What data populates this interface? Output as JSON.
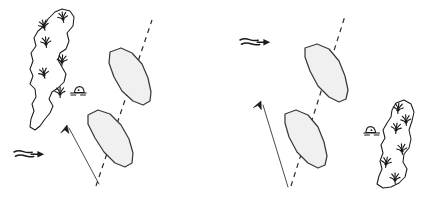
{
  "figure": {
    "background_color": "#ffffff",
    "ink_color": "#1a1a1a",
    "hull_fill_color": "#f0f0f0",
    "hull_stroke_color": "#3a3a3a",
    "width": 431,
    "height": 213
  },
  "panels": [
    {
      "id": "panel-left",
      "name": "left-scenario",
      "island": {
        "name": "island-left",
        "label": "",
        "outline_points": "55,12 62,9 70,11 74,17 73,26 67,33 69,41 66,49 60,53 58,60 62,67 66,74 64,82 58,88 52,92 49,99 53,106 50,113 45,119 40,126 35,130 30,127 31,119 34,111 32,104 36,97 35,89 30,84 33,76 30,69 33,61 31,53 36,46 34,38 38,31 44,26 48,19",
        "vegetation": [
          {
            "name": "grass-tuft",
            "x": 63,
            "y": 19,
            "rotation": -8
          },
          {
            "name": "grass-tuft",
            "x": 44,
            "y": 27,
            "rotation": -14
          },
          {
            "name": "grass-tuft",
            "x": 46,
            "y": 44,
            "rotation": -5
          },
          {
            "name": "grass-tuft",
            "x": 62,
            "y": 62,
            "rotation": 4
          },
          {
            "name": "grass-tuft",
            "x": 44,
            "y": 75,
            "rotation": -12
          },
          {
            "name": "grass-tuft",
            "x": 60,
            "y": 94,
            "rotation": 0
          }
        ]
      },
      "rock_marker": {
        "name": "rock-marker-left",
        "x": 79,
        "y": 90,
        "flip": false
      },
      "boats": [
        {
          "name": "boat-upper-left",
          "hull_points": "110,52 121,48 132,53 142,64 148,78 151,92 150,101 143,105 133,101 122,91 114,77 109,63",
          "heading_deg": 148
        },
        {
          "name": "boat-lower-left",
          "hull_points": "88,115 98,110 110,114 121,125 129,139 133,153 132,163 125,167 115,163 104,152 95,138 88,124",
          "heading_deg": 148
        }
      ],
      "course_line": {
        "name": "course-line-left",
        "x1": 96,
        "y1": 186,
        "x2": 152,
        "y2": 20,
        "style": "dashed"
      },
      "bearing_arrow": {
        "name": "bearing-arrow-left",
        "x1": 99,
        "y1": 184,
        "x2": 68,
        "y2": 126,
        "head_at": "x2"
      },
      "wind_arrow": {
        "name": "wind-arrow-left",
        "x": 14,
        "y": 150,
        "direction": "right",
        "label": ""
      }
    },
    {
      "id": "panel-right",
      "name": "right-scenario",
      "island": {
        "name": "island-right",
        "label": "",
        "outline_points": "396,103 404,100 411,104 414,112 412,121 409,130 411,139 409,148 404,154 403,162 407,169 405,177 399,183 391,187 383,188 377,184 379,176 382,169 380,161 383,153 381,145 385,138 383,130 387,123 391,117 392,110",
        "vegetation": [
          {
            "name": "grass-tuft",
            "x": 398,
            "y": 110,
            "rotation": 6
          },
          {
            "name": "grass-tuft",
            "x": 406,
            "y": 122,
            "rotation": -4
          },
          {
            "name": "grass-tuft",
            "x": 396,
            "y": 130,
            "rotation": 8
          },
          {
            "name": "grass-tuft",
            "x": 402,
            "y": 151,
            "rotation": -6
          },
          {
            "name": "grass-tuft",
            "x": 386,
            "y": 164,
            "rotation": 10
          },
          {
            "name": "grass-tuft",
            "x": 395,
            "y": 180,
            "rotation": 0
          }
        ]
      },
      "rock_marker": {
        "name": "rock-marker-right",
        "x": 371,
        "y": 130,
        "flip": true
      },
      "boats": [
        {
          "name": "boat-upper-right",
          "hull_points": "305,48 317,44 329,49 339,61 345,76 348,90 346,99 339,102 329,97 318,86 310,71 305,57",
          "heading_deg": 150
        },
        {
          "name": "boat-lower-right",
          "hull_points": "285,114 296,110 308,115 318,127 324,142 327,156 325,165 318,168 308,163 297,152 289,137 285,123",
          "heading_deg": 150
        }
      ],
      "course_line": {
        "name": "course-line-right",
        "x1": 291,
        "y1": 186,
        "x2": 345,
        "y2": 16,
        "style": "dashed"
      },
      "bearing_arrow": {
        "name": "bearing-arrow-right",
        "x1": 288,
        "y1": 187,
        "x2": 262,
        "y2": 102,
        "head_at": "x2"
      },
      "wind_arrow": {
        "name": "wind-arrow-right",
        "x": 240,
        "y": 38,
        "direction": "right",
        "label": ""
      }
    }
  ],
  "legend": {
    "items": [
      {
        "name": "wind-symbol",
        "meaning": "wind direction"
      },
      {
        "name": "course-line-symbol",
        "meaning": "course / transit line"
      },
      {
        "name": "bearing-arrow-symbol",
        "meaning": "bearing to landmark"
      },
      {
        "name": "island-symbol",
        "meaning": "vegetated island"
      },
      {
        "name": "rock-symbol",
        "meaning": "rock / above-water hazard"
      }
    ]
  }
}
